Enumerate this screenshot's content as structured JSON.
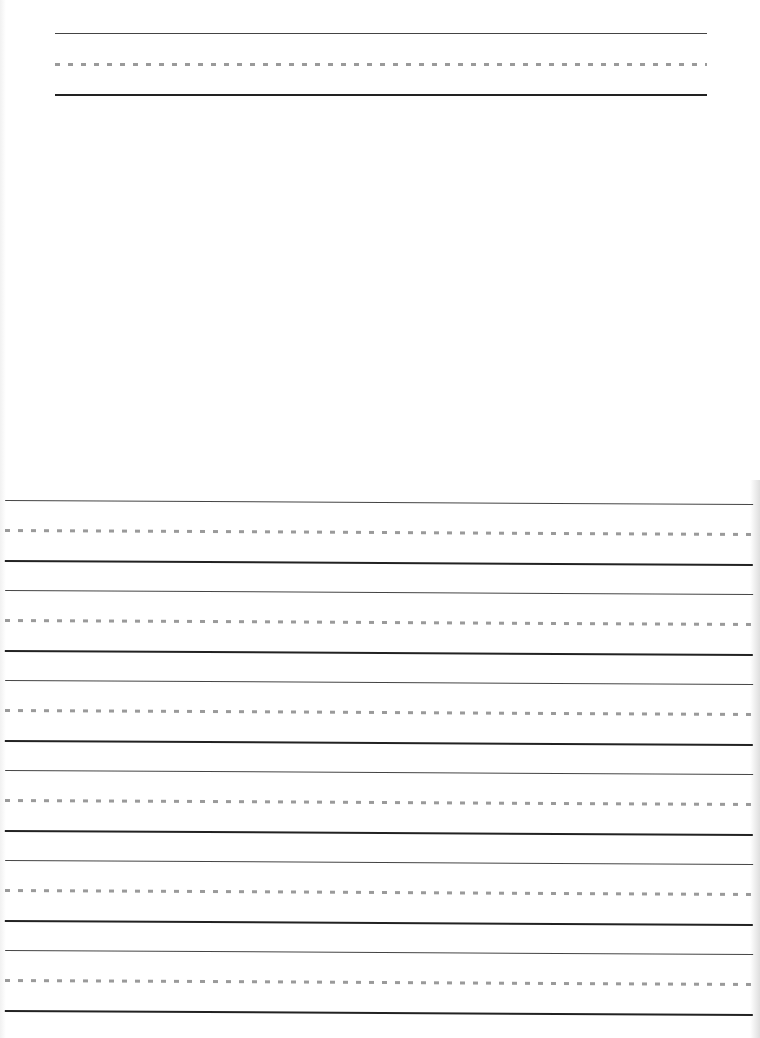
{
  "document": {
    "type": "handwriting practice paper",
    "colors": {
      "background": "#ffffff",
      "top_line": "#444444",
      "dashed_midline": "#9a9a9a",
      "baseline": "#222222"
    },
    "header_group": {
      "left": 55,
      "width": 652,
      "top": 33,
      "mid_offset": 31,
      "base_offset": 61
    },
    "ruled_groups": [
      {
        "top": 500
      },
      {
        "top": 590
      },
      {
        "top": 680
      },
      {
        "top": 770
      },
      {
        "top": 860
      },
      {
        "top": 950
      }
    ],
    "ruled_group_left": 5,
    "ruled_group_width": 748,
    "ruled_mid_offset": 30,
    "ruled_base_offset": 60
  }
}
